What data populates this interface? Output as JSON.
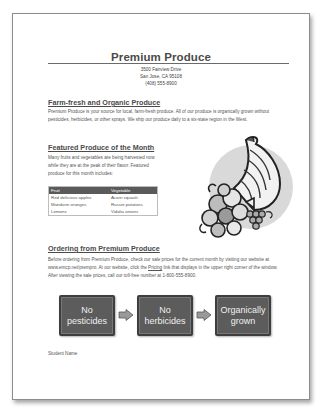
{
  "document": {
    "title": "Premium Produce",
    "address": {
      "street": "3500 Fairview Drive",
      "city": "San Jose, CA 95108",
      "phone": "(408) 555-8900"
    },
    "sections": {
      "farm": {
        "heading": "Farm-fresh and Organic Produce",
        "body": "Premium Produce is your source for local, farm-fresh produce. All of our produce is organically grown without pesticides, herbicides, or other sprays. We ship our produce daily to a six-state region in the West."
      },
      "featured": {
        "heading": "Featured Produce of the Month",
        "body": "Many fruits and vegetables are being harvested now while they are at the peak of their flavor. Featured produce for this month includes:"
      },
      "order": {
        "heading": "Ordering from Premium Produce",
        "body_before_link": "Before ordering from Premium Produce, check our sale prices for the current month by visiting our website at www.emcp.net/prempro. At our website, click the ",
        "link": "Pricing",
        "body_after_link": " link that displays in the upper right corner of the window. After viewing the sale prices, call our toll-free number at 1-800-555-8900."
      }
    },
    "produce_table": {
      "headers": [
        "Fruit",
        "Vegetable"
      ],
      "rows": [
        [
          "Red delicious apples",
          "Acorn squash"
        ],
        [
          "Mandarin oranges",
          "Russet potatoes"
        ],
        [
          "Lemons",
          "Vidalia onions"
        ]
      ]
    },
    "flow": [
      {
        "line1": "No",
        "line2": "pesticides"
      },
      {
        "line1": "No",
        "line2": "herbicides"
      },
      {
        "line1": "Organically",
        "line2": "grown"
      }
    ],
    "image": "cornucopia-clipart",
    "footer": "Student Name"
  }
}
